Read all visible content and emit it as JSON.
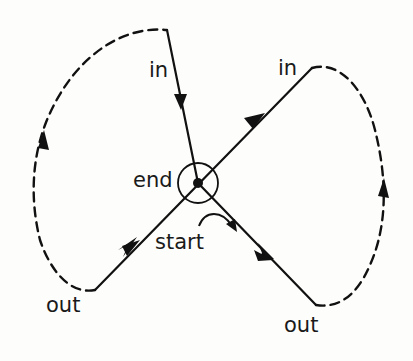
{
  "diagram": {
    "labels": {
      "in_left": "in",
      "in_right": "in",
      "end": "end",
      "start": "start",
      "out_left": "out",
      "out_right": "out"
    },
    "colors": {
      "stroke": "#111111",
      "background": "#fdfdfb"
    },
    "nodes": {
      "center": {
        "x": 198,
        "y": 183
      },
      "in_left_end": {
        "x": 167,
        "y": 30
      },
      "in_right_end": {
        "x": 312,
        "y": 68
      },
      "out_left_end": {
        "x": 95,
        "y": 290
      },
      "out_right_end": {
        "x": 316,
        "y": 305
      }
    }
  }
}
